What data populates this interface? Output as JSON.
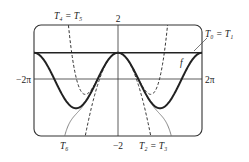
{
  "chart_data": {
    "type": "line",
    "title": "",
    "xlabel": "",
    "ylabel": "",
    "xlim": [
      -6.2832,
      6.2832
    ],
    "ylim": [
      -2,
      2
    ],
    "x_tick_labels": {
      "left": "−2π",
      "right": "2π"
    },
    "y_tick_labels": {
      "top": "2",
      "bottom": "−2"
    },
    "grid": false,
    "series": [
      {
        "name": "f",
        "expr": "cos(x)",
        "style": "thick",
        "coeffs": null
      },
      {
        "name": "T0 = T1",
        "expr": "1",
        "style": "solid",
        "coeffs": [
          1
        ]
      },
      {
        "name": "T2 = T3",
        "expr": "1 - x^2/2",
        "style": "dashed",
        "coeffs": [
          1,
          0,
          -0.5
        ]
      },
      {
        "name": "T4 = T5",
        "expr": "1 - x^2/2 + x^4/24",
        "style": "dashed",
        "coeffs": [
          1,
          0,
          -0.5,
          0,
          0.0416667
        ]
      },
      {
        "name": "T6",
        "expr": "1 - x^2/2 + x^4/24 - x^6/720",
        "style": "thin",
        "coeffs": [
          1,
          0,
          -0.5,
          0,
          0.0416667,
          0,
          -0.00138889
        ]
      }
    ],
    "annotations": {
      "T4_T5": "T₄ = T₅",
      "T0_T1": "T₀ = T₁",
      "f": "f",
      "T6": "T₆",
      "T2_T3": "T₂ = T₃"
    }
  }
}
